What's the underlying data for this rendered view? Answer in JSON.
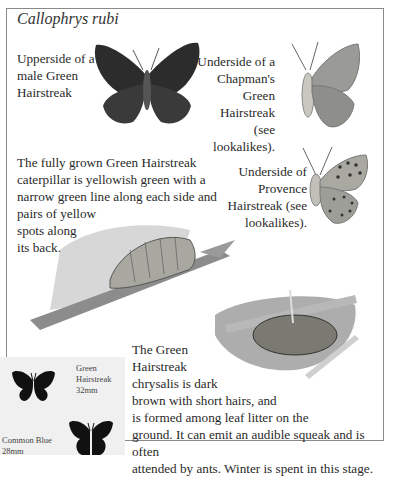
{
  "title": "Callophrys rubi",
  "captions": {
    "upperside": [
      "Upperside of a",
      "male Green",
      "Hairstreak"
    ],
    "chapmans": [
      "Underside of a",
      "Chapman's",
      "Green Hairstreak",
      "(see lookalikes)."
    ],
    "caterpillar": [
      "The fully grown Green Hairstreak",
      "caterpillar is yellowish green with a",
      "narrow green line along each side and",
      "pairs of yellow",
      "spots along",
      "its back."
    ],
    "provence": [
      "Underside of",
      "Provence",
      "Hairstreak (see",
      "lookalikes)."
    ],
    "chrysalis": [
      "The Green",
      "Hairstreak",
      "chrysalis is dark",
      "brown with short hairs, and",
      "is formed among leaf litter on the",
      "ground. It can emit an audible squeak and is often",
      "attended by ants. Winter is spent in this stage."
    ]
  },
  "size_comparison": {
    "green_hairstreak": {
      "name_line1": "Green",
      "name_line2": "Hairstreak",
      "size": "32mm"
    },
    "common_blue": {
      "name": "Common Blue",
      "size": "28mm"
    }
  },
  "colors": {
    "frame": "#8a8a8a",
    "size_box": "#f0f0f0",
    "text": "#2a2a2a"
  }
}
